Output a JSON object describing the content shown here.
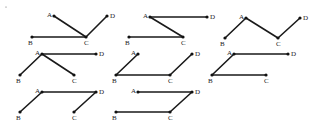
{
  "figure": {
    "colors": {
      "line": "#1a1a1a",
      "point": "#111111",
      "label": "#222222",
      "background": "#ffffff"
    },
    "panels": [
      {
        "id": 1,
        "points": {
          "A": [
            54,
            16
          ],
          "B": [
            32,
            37
          ],
          "C": [
            86,
            37
          ],
          "D": [
            107,
            16
          ]
        },
        "labels": {
          "A": [
            47,
            17
          ],
          "B": [
            28,
            45
          ],
          "C": [
            84,
            45
          ],
          "D": [
            110,
            18
          ]
        },
        "edges": [
          [
            "A",
            "C"
          ],
          [
            "B",
            "C"
          ],
          [
            "C",
            "D"
          ]
        ]
      },
      {
        "id": 2,
        "points": {
          "A": [
            150,
            17
          ],
          "B": [
            129,
            37
          ],
          "C": [
            183,
            37
          ],
          "D": [
            207,
            17
          ]
        },
        "labels": {
          "A": [
            143,
            18
          ],
          "B": [
            125,
            45
          ],
          "C": [
            181,
            45
          ],
          "D": [
            210,
            19
          ]
        },
        "edges": [
          [
            "A",
            "D"
          ],
          [
            "A",
            "C"
          ],
          [
            "B",
            "C"
          ]
        ]
      },
      {
        "id": 3,
        "points": {
          "A": [
            246,
            18
          ],
          "B": [
            225,
            38
          ],
          "C": [
            278,
            38
          ],
          "D": [
            300,
            18
          ]
        },
        "labels": {
          "A": [
            239,
            19
          ],
          "B": [
            220,
            46
          ],
          "C": [
            276,
            46
          ],
          "D": [
            303,
            20
          ]
        },
        "edges": [
          [
            "B",
            "A"
          ],
          [
            "A",
            "C"
          ],
          [
            "C",
            "D"
          ]
        ]
      },
      {
        "id": 4,
        "points": {
          "A": [
            42,
            54
          ],
          "B": [
            20,
            75
          ],
          "C": [
            74,
            75
          ],
          "D": [
            96,
            54
          ]
        },
        "labels": {
          "A": [
            35,
            55
          ],
          "B": [
            16,
            83
          ],
          "C": [
            72,
            83
          ],
          "D": [
            99,
            56
          ]
        },
        "edges": [
          [
            "A",
            "D"
          ],
          [
            "A",
            "B"
          ],
          [
            "A",
            "C"
          ]
        ]
      },
      {
        "id": 5,
        "points": {
          "A": [
            138,
            54
          ],
          "B": [
            116,
            75
          ],
          "C": [
            170,
            75
          ],
          "D": [
            192,
            54
          ]
        },
        "labels": {
          "A": [
            131,
            55
          ],
          "B": [
            112,
            83
          ],
          "C": [
            168,
            83
          ],
          "D": [
            195,
            56
          ]
        },
        "edges": [
          [
            "A",
            "B"
          ],
          [
            "B",
            "C"
          ],
          [
            "C",
            "D"
          ]
        ]
      },
      {
        "id": 6,
        "points": {
          "A": [
            234,
            54
          ],
          "B": [
            212,
            75
          ],
          "C": [
            266,
            75
          ],
          "D": [
            288,
            54
          ]
        },
        "labels": {
          "A": [
            227,
            55
          ],
          "B": [
            208,
            83
          ],
          "C": [
            264,
            83
          ],
          "D": [
            291,
            56
          ]
        },
        "edges": [
          [
            "A",
            "D"
          ],
          [
            "A",
            "B"
          ],
          [
            "B",
            "C"
          ]
        ]
      },
      {
        "id": 7,
        "points": {
          "A": [
            42,
            92
          ],
          "B": [
            20,
            112
          ],
          "C": [
            74,
            112
          ],
          "D": [
            96,
            92
          ]
        },
        "labels": {
          "A": [
            35,
            93
          ],
          "B": [
            16,
            120
          ],
          "C": [
            72,
            120
          ],
          "D": [
            99,
            94
          ]
        },
        "edges": [
          [
            "A",
            "D"
          ],
          [
            "A",
            "B"
          ],
          [
            "D",
            "C"
          ]
        ]
      },
      {
        "id": 8,
        "points": {
          "A": [
            138,
            92
          ],
          "B": [
            116,
            112
          ],
          "C": [
            170,
            112
          ],
          "D": [
            192,
            92
          ]
        },
        "labels": {
          "A": [
            131,
            93
          ],
          "B": [
            112,
            120
          ],
          "C": [
            168,
            120
          ],
          "D": [
            195,
            94
          ]
        },
        "edges": [
          [
            "A",
            "D"
          ],
          [
            "B",
            "C"
          ],
          [
            "C",
            "D"
          ]
        ]
      }
    ],
    "specks": [
      [
        6,
        7
      ]
    ]
  }
}
